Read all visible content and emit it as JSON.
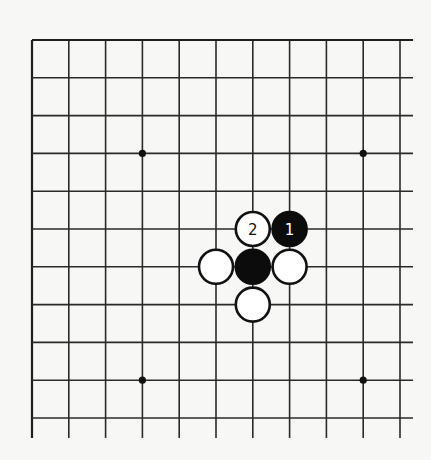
{
  "diagram": {
    "type": "go-board-partial",
    "grid": {
      "columns": 11,
      "rows": 11,
      "origin_x": 32,
      "origin_y": 40,
      "spacing_x": 36.8,
      "spacing_y": 37.8,
      "left_edge_closed": true,
      "top_edge_closed": true,
      "right_overhang": 13,
      "bottom_overhang": 20,
      "line_color": "#2a2a2a"
    },
    "star_points": [
      {
        "col": 3,
        "row": 3
      },
      {
        "col": 9,
        "row": 3
      },
      {
        "col": 3,
        "row": 9
      },
      {
        "col": 9,
        "row": 9
      }
    ],
    "stones": [
      {
        "col": 6,
        "row": 5,
        "color": "white",
        "label": "2"
      },
      {
        "col": 7,
        "row": 5,
        "color": "black",
        "label": "1"
      },
      {
        "col": 5,
        "row": 6,
        "color": "white",
        "label": ""
      },
      {
        "col": 6,
        "row": 6,
        "color": "black",
        "label": ""
      },
      {
        "col": 7,
        "row": 6,
        "color": "white",
        "label": ""
      },
      {
        "col": 6,
        "row": 7,
        "color": "white",
        "label": ""
      }
    ],
    "stone_radius": 17,
    "colors": {
      "background": "#f7f7f5",
      "black_stone": "#0c0c0c",
      "white_stone": "#ffffff"
    }
  }
}
